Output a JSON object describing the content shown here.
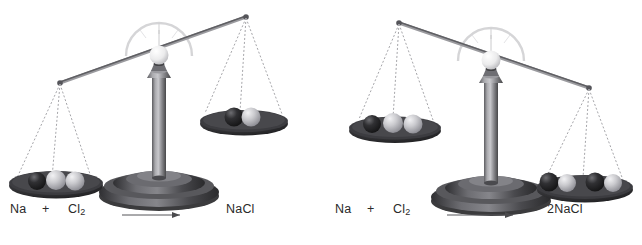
{
  "figure": {
    "background_color": "#ffffff",
    "width": 642,
    "height": 245
  },
  "colors": {
    "background": "#ffffff",
    "text": "#2a2a2a",
    "beam": "#6a6a6a",
    "chain": "#9a9a9a",
    "pan_dark": "#2e2e30",
    "pan_mid": "#4a4a4d",
    "column_light": "#b9b9bd",
    "column_dark": "#4e4e52",
    "base_dark": "#3a3a3d",
    "sphere_dark": "#242426",
    "sphere_light": "#c9c9cb",
    "pointer_ball": "#efefef",
    "arc": "#d8d8d8",
    "arrow": "#4a4a4a"
  },
  "panels": [
    {
      "id": "unbalanced-scale",
      "name": "left-balance",
      "state": "unbalanced",
      "tilt": "left-side-down",
      "equation": {
        "reactant1": "Na",
        "plus": "+",
        "reactant2_formula": "Cl",
        "reactant2_subscript": "2",
        "arrow": "arrow-right-icon",
        "product": "NaCl"
      },
      "left_pan": {
        "label": "reactants-pan",
        "position": "down",
        "spheres": [
          {
            "element": "Na",
            "shade": "dark"
          },
          {
            "element": "Cl",
            "shade": "light"
          },
          {
            "element": "Cl",
            "shade": "light"
          }
        ],
        "sphere_count": 3
      },
      "right_pan": {
        "label": "products-pan",
        "position": "up",
        "spheres": [
          {
            "element": "Na",
            "shade": "dark"
          },
          {
            "element": "Cl",
            "shade": "light"
          }
        ],
        "sphere_count": 2
      }
    },
    {
      "id": "balanced-scale",
      "name": "right-balance",
      "state": "balanced-mass",
      "tilt": "right-side-down",
      "equation": {
        "reactant1": "Na",
        "plus": "+",
        "reactant2_formula": "Cl",
        "reactant2_subscript": "2",
        "arrow": "arrow-right-icon",
        "product": "2NaCl"
      },
      "left_pan": {
        "label": "reactants-pan",
        "position": "up",
        "spheres": [
          {
            "element": "Na",
            "shade": "dark"
          },
          {
            "element": "Cl",
            "shade": "light"
          },
          {
            "element": "Cl",
            "shade": "light"
          }
        ],
        "sphere_count": 3
      },
      "right_pan": {
        "label": "products-pan",
        "position": "down",
        "spheres": [
          {
            "element": "Na",
            "shade": "dark"
          },
          {
            "element": "Cl",
            "shade": "light"
          },
          {
            "element": "Na",
            "shade": "dark"
          },
          {
            "element": "Cl",
            "shade": "light"
          }
        ],
        "sphere_count": 4
      }
    }
  ]
}
